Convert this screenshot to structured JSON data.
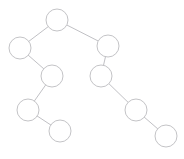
{
  "figure": {
    "kind": "binary-tree-diagram",
    "width": 184,
    "height": 159,
    "background_color": "#ffffff",
    "node_fill_color": "#ffffff",
    "node_stroke_color": "#bcbcc0",
    "edge_stroke_color": "#b9b9bd",
    "stroke_width": 0.9,
    "node_count": 9,
    "edge_count": 8
  },
  "chart_data": {
    "type": "diagram",
    "title": "",
    "xlabel": "",
    "ylabel": "",
    "grid": false,
    "legend": "none",
    "nodes": [
      {
        "id": "n0",
        "label": "",
        "cx": 57,
        "cy": 20,
        "r": 11,
        "depth": 0,
        "role": "root"
      },
      {
        "id": "n1",
        "label": "",
        "cx": 20,
        "cy": 48,
        "r": 11,
        "depth": 1,
        "role": "left-child"
      },
      {
        "id": "n2",
        "label": "",
        "cx": 108,
        "cy": 46,
        "r": 11,
        "depth": 1,
        "role": "right-child"
      },
      {
        "id": "n3",
        "label": "",
        "cx": 52,
        "cy": 76,
        "r": 11,
        "depth": 2,
        "role": "right-child"
      },
      {
        "id": "n4",
        "label": "",
        "cx": 101,
        "cy": 76,
        "r": 11,
        "depth": 2,
        "role": "left-child"
      },
      {
        "id": "n5",
        "label": "",
        "cx": 28,
        "cy": 110,
        "r": 11,
        "depth": 3,
        "role": "left-child"
      },
      {
        "id": "n6",
        "label": "",
        "cx": 136,
        "cy": 110,
        "r": 11,
        "depth": 3,
        "role": "right-child"
      },
      {
        "id": "n7",
        "label": "",
        "cx": 60,
        "cy": 131,
        "r": 11,
        "depth": 4,
        "role": "right-child"
      },
      {
        "id": "n8",
        "label": "",
        "cx": 166,
        "cy": 136,
        "r": 11,
        "depth": 4,
        "role": "right-child"
      }
    ],
    "edges": [
      {
        "from": "n0",
        "to": "n1",
        "x1": 57,
        "y1": 20,
        "x2": 20,
        "y2": 48
      },
      {
        "from": "n0",
        "to": "n2",
        "x1": 57,
        "y1": 20,
        "x2": 108,
        "y2": 46
      },
      {
        "from": "n1",
        "to": "n3",
        "x1": 20,
        "y1": 48,
        "x2": 52,
        "y2": 76
      },
      {
        "from": "n3",
        "to": "n5",
        "x1": 52,
        "y1": 76,
        "x2": 28,
        "y2": 110
      },
      {
        "from": "n5",
        "to": "n7",
        "x1": 28,
        "y1": 110,
        "x2": 60,
        "y2": 131
      },
      {
        "from": "n2",
        "to": "n4",
        "x1": 108,
        "y1": 46,
        "x2": 101,
        "y2": 76
      },
      {
        "from": "n4",
        "to": "n6",
        "x1": 101,
        "y1": 76,
        "x2": 136,
        "y2": 110
      },
      {
        "from": "n6",
        "to": "n8",
        "x1": 136,
        "y1": 110,
        "x2": 166,
        "y2": 136
      }
    ]
  }
}
